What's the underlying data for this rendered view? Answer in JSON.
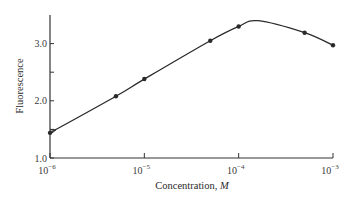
{
  "chart_data": {
    "type": "line",
    "title": "",
    "xlabel": "Concentration, M",
    "xlabel_text": "Concentration, ",
    "xlabel_unit": "M",
    "ylabel": "Fluorescence",
    "xscale": "log",
    "xlim": [
      1e-06,
      0.001
    ],
    "ylim": [
      1.0,
      3.5
    ],
    "grid": false,
    "legend": null,
    "x_ticks": [
      {
        "value": 1e-06,
        "label_base": "10",
        "label_exp": "−6"
      },
      {
        "value": 1e-05,
        "label_base": "10",
        "label_exp": "−5"
      },
      {
        "value": 0.0001,
        "label_base": "10",
        "label_exp": "−4"
      },
      {
        "value": 0.001,
        "label_base": "10",
        "label_exp": "−3"
      }
    ],
    "y_ticks": [
      {
        "value": 1.0,
        "label": "1.0"
      },
      {
        "value": 2.0,
        "label": "2.0"
      },
      {
        "value": 3.0,
        "label": "3.0"
      }
    ],
    "y_minor_ticks": [
      1.5,
      2.5
    ],
    "series": [
      {
        "name": "Fluorescence",
        "markers": true,
        "x": [
          1e-06,
          5e-06,
          1e-05,
          5e-05,
          0.0001,
          0.0005,
          0.001
        ],
        "y": [
          1.44,
          2.08,
          2.38,
          3.05,
          3.3,
          3.19,
          2.97
        ]
      }
    ],
    "curve_peak": {
      "x": 0.00016,
      "y": 3.4
    },
    "annotations": []
  },
  "colors": {
    "line": "#2a2a2a",
    "axis": "#333333",
    "background": "#ffffff"
  }
}
